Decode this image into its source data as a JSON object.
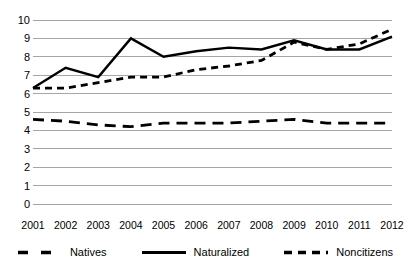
{
  "chart_data": {
    "type": "line",
    "title": "",
    "xlabel": "",
    "ylabel": "",
    "categories": [
      "2001",
      "2002",
      "2003",
      "2004",
      "2005",
      "2006",
      "2007",
      "2008",
      "2009",
      "2010",
      "2011",
      "2012"
    ],
    "ylim": [
      0,
      10
    ],
    "ytick_step": 1,
    "yticks": [
      "10",
      "9",
      "8",
      "7",
      "6",
      "5",
      "4",
      "3",
      "2",
      "1",
      "0"
    ],
    "grid": "horizontal",
    "legend_position": "bottom",
    "series": [
      {
        "name": "Natives",
        "style": "dashed",
        "color": "#000000",
        "values": [
          4.6,
          4.5,
          4.3,
          4.2,
          4.4,
          4.4,
          4.4,
          4.5,
          4.6,
          4.4,
          4.4,
          4.4
        ]
      },
      {
        "name": "Naturalized",
        "style": "solid",
        "color": "#000000",
        "values": [
          6.3,
          7.4,
          6.9,
          9.0,
          8.0,
          8.3,
          8.5,
          8.4,
          8.9,
          8.4,
          8.4,
          9.1
        ]
      },
      {
        "name": "Noncitizens",
        "style": "dashed-short",
        "color": "#000000",
        "values": [
          6.3,
          6.3,
          6.6,
          6.9,
          6.9,
          7.3,
          7.5,
          7.8,
          8.8,
          8.4,
          8.7,
          9.5
        ]
      }
    ],
    "gridline_color": "#a6a6a6",
    "background": "#ffffff"
  }
}
